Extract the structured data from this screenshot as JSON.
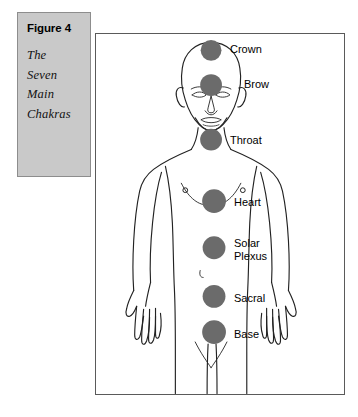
{
  "caption": {
    "title": "Figure 4",
    "lines": [
      "The",
      "Seven",
      "Main",
      "Chakras"
    ]
  },
  "illustration": {
    "subject": "human-figure-front-view",
    "colors": {
      "chakra_fill": "#6b6b6b",
      "outline": "#222222",
      "frame_border": "#5a5a5a",
      "caption_background": "#c9c9c9",
      "caption_border": "#8d8d8d",
      "page_background": "#ffffff"
    }
  },
  "chakras": [
    {
      "name": "Crown",
      "label": "Crown",
      "order": 1,
      "cx": 116,
      "cy": 16,
      "r": 10.5,
      "label_x": 134,
      "label_y": 10
    },
    {
      "name": "Brow",
      "label": "Brow",
      "order": 2,
      "cx": 116,
      "cy": 51,
      "r": 11,
      "label_x": 148,
      "label_y": 42
    },
    {
      "name": "Throat",
      "label": "Throat",
      "order": 3,
      "cx": 116,
      "cy": 106,
      "r": 11,
      "label_x": 134,
      "label_y": 100
    },
    {
      "name": "Heart",
      "label": "Heart",
      "order": 4,
      "cx": 119,
      "cy": 168,
      "r": 12,
      "label_x": 138,
      "label_y": 166
    },
    {
      "name": "Solar Plexus",
      "label": "Solar\nPlexus",
      "order": 5,
      "cx": 119,
      "cy": 215,
      "r": 11.5,
      "label_x": 138,
      "label_y": 206
    },
    {
      "name": "Sacral",
      "label": "Sacral",
      "order": 6,
      "cx": 119,
      "cy": 264,
      "r": 11.5,
      "label_x": 138,
      "label_y": 258
    },
    {
      "name": "Base",
      "label": "Base",
      "order": 7,
      "cx": 119,
      "cy": 300,
      "r": 12,
      "label_x": 138,
      "label_y": 295
    }
  ]
}
